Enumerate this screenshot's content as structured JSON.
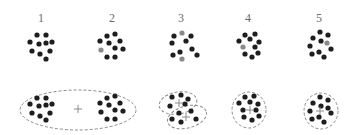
{
  "figure": {
    "colors": {
      "dot": "#1e1e1e",
      "highlight_dot": "#8a8a8a",
      "outline": "#8c8c8c",
      "plus": "#8c8c8c",
      "label": "#6a6a6a"
    },
    "panels": [
      {
        "label": "1",
        "x": 41,
        "dots": [
          [
            37,
            35,
            0
          ],
          [
            46,
            35,
            0
          ],
          [
            30,
            42,
            0
          ],
          [
            39,
            44,
            0
          ],
          [
            46,
            43,
            0
          ],
          [
            52,
            42,
            0
          ],
          [
            32,
            51,
            0
          ],
          [
            40,
            54,
            0
          ],
          [
            50,
            51,
            0
          ],
          [
            46,
            59,
            0
          ]
        ]
      },
      {
        "label": "2",
        "x": 112,
        "dots": [
          [
            107,
            36,
            0
          ],
          [
            115,
            34,
            0
          ],
          [
            100,
            41,
            0
          ],
          [
            109,
            43,
            0
          ],
          [
            120,
            41,
            0
          ],
          [
            101,
            50,
            1
          ],
          [
            115,
            48,
            0
          ],
          [
            123,
            49,
            0
          ],
          [
            107,
            57,
            0
          ],
          [
            115,
            57,
            0
          ]
        ]
      },
      {
        "label": "3",
        "x": 181,
        "dots": [
          [
            174,
            36,
            0
          ],
          [
            182,
            33,
            1
          ],
          [
            191,
            36,
            0
          ],
          [
            172,
            43,
            0
          ],
          [
            186,
            41,
            0
          ],
          [
            192,
            49,
            0
          ],
          [
            180,
            52,
            0
          ],
          [
            173,
            55,
            0
          ],
          [
            182,
            59,
            1
          ],
          [
            197,
            55,
            0
          ]
        ]
      },
      {
        "label": "4",
        "x": 248,
        "dots": [
          [
            245,
            35,
            0
          ],
          [
            255,
            34,
            0
          ],
          [
            239,
            41,
            0
          ],
          [
            250,
            39,
            0
          ],
          [
            259,
            42,
            0
          ],
          [
            243,
            47,
            1
          ],
          [
            255,
            47,
            0
          ],
          [
            245,
            54,
            0
          ],
          [
            252,
            57,
            0
          ],
          [
            258,
            53,
            0
          ]
        ]
      },
      {
        "label": "5",
        "x": 319,
        "dots": [
          [
            320,
            32,
            0
          ],
          [
            328,
            35,
            0
          ],
          [
            313,
            38,
            0
          ],
          [
            321,
            41,
            0
          ],
          [
            327,
            43,
            1
          ],
          [
            310,
            46,
            0
          ],
          [
            331,
            49,
            0
          ],
          [
            312,
            54,
            0
          ],
          [
            319,
            52,
            0
          ],
          [
            324,
            57,
            0
          ]
        ]
      }
    ],
    "clusterings": [
      {
        "name": "one-cluster-two-groups",
        "outlines": [
          {
            "cx": 78,
            "cy": 110,
            "rx": 58,
            "ry": 20,
            "rot": 0
          }
        ],
        "plus": [
          [
            78,
            109
          ]
        ],
        "dots": [
          [
            37,
            98
          ],
          [
            46,
            98
          ],
          [
            30,
            104
          ],
          [
            39,
            106
          ],
          [
            46,
            105
          ],
          [
            52,
            104
          ],
          [
            32,
            113
          ],
          [
            40,
            116
          ],
          [
            50,
            113
          ],
          [
            46,
            120
          ],
          [
            107,
            98
          ],
          [
            115,
            96
          ],
          [
            100,
            103
          ],
          [
            109,
            105
          ],
          [
            120,
            103
          ],
          [
            101,
            112
          ],
          [
            115,
            110
          ],
          [
            123,
            111
          ],
          [
            107,
            119
          ],
          [
            115,
            119
          ]
        ]
      },
      {
        "name": "two-clusters",
        "outlines": [
          {
            "cx": 178,
            "cy": 103,
            "rx": 19,
            "ry": 11,
            "rot": -10
          },
          {
            "cx": 187,
            "cy": 117,
            "rx": 20,
            "ry": 11,
            "rot": -15
          }
        ],
        "plus": [
          [
            179,
            103
          ],
          [
            186,
            117
          ]
        ],
        "dots": [
          [
            172,
            97
          ],
          [
            181,
            95
          ],
          [
            188,
            99
          ],
          [
            170,
            106
          ],
          [
            185,
            104
          ],
          [
            191,
            111
          ],
          [
            179,
            113
          ],
          [
            172,
            119
          ],
          [
            181,
            122
          ],
          [
            196,
            119
          ]
        ]
      },
      {
        "name": "single-cluster-4",
        "outlines": [
          {
            "cx": 249,
            "cy": 110,
            "rx": 17,
            "ry": 18,
            "rot": 0
          }
        ],
        "plus": [
          [
            250,
            110
          ]
        ],
        "dots": [
          [
            245,
            97
          ],
          [
            254,
            96
          ],
          [
            239,
            103
          ],
          [
            250,
            102
          ],
          [
            258,
            104
          ],
          [
            243,
            110
          ],
          [
            256,
            110
          ],
          [
            244,
            117
          ],
          [
            252,
            120
          ],
          [
            259,
            116
          ]
        ]
      },
      {
        "name": "single-cluster-5",
        "outlines": [
          {
            "cx": 321,
            "cy": 111,
            "rx": 17,
            "ry": 18,
            "rot": 0
          }
        ],
        "plus": [
          [
            320,
            111
          ]
        ],
        "dots": [
          [
            320,
            97
          ],
          [
            328,
            100
          ],
          [
            313,
            103
          ],
          [
            321,
            106
          ],
          [
            328,
            108
          ],
          [
            310,
            111
          ],
          [
            331,
            113
          ],
          [
            312,
            119
          ],
          [
            319,
            117
          ],
          [
            324,
            122
          ]
        ]
      }
    ]
  }
}
